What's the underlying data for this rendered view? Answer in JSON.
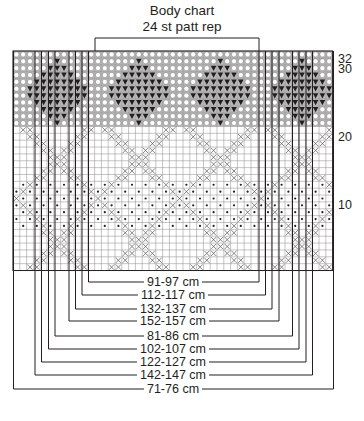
{
  "header": {
    "title": "Body chart",
    "subtitle": "24 st patt rep"
  },
  "row_labels": [
    {
      "label": "32",
      "y": 53
    },
    {
      "label": "30",
      "y": 63
    },
    {
      "label": "20",
      "y": 131
    },
    {
      "label": "10",
      "y": 199
    }
  ],
  "grid": {
    "left": 13,
    "top": 51,
    "cols": 47,
    "rows": 32,
    "cell_w": 6.8,
    "cell_h": 6.86,
    "repeat": {
      "start_x": 95,
      "end_x": 259,
      "label_stitches": 24
    },
    "colors": {
      "line": "#8a8a8a",
      "bold": "#231f20",
      "shade": "#b9b9b9",
      "symbol": "#231f20"
    }
  },
  "symbols_legend": {
    "circle": "light background circle",
    "triangle": "black triangle",
    "cross": "X cross",
    "dot": "dot"
  },
  "sizes": [
    {
      "label": "91-97 cm",
      "left_x": 88.5,
      "right_x": 259,
      "y": 282
    },
    {
      "label": "112-117 cm",
      "left_x": 82,
      "right_x": 265.5,
      "y": 295
    },
    {
      "label": "132-137 cm",
      "left_x": 75.5,
      "right_x": 272,
      "y": 309
    },
    {
      "label": "152-157 cm",
      "left_x": 69,
      "right_x": 279,
      "y": 321
    },
    {
      "label": "81-86 cm",
      "left_x": 55,
      "right_x": 292.5,
      "y": 336
    },
    {
      "label": "102-107 cm",
      "left_x": 48.5,
      "right_x": 299,
      "y": 349
    },
    {
      "label": "122-127 cm",
      "left_x": 41.5,
      "right_x": 306,
      "y": 362
    },
    {
      "label": "142-147 cm",
      "left_x": 35,
      "right_x": 312.5,
      "y": 375
    },
    {
      "label": "71-76 cm",
      "left_x": 13.5,
      "right_x": 333.5,
      "y": 389
    }
  ]
}
